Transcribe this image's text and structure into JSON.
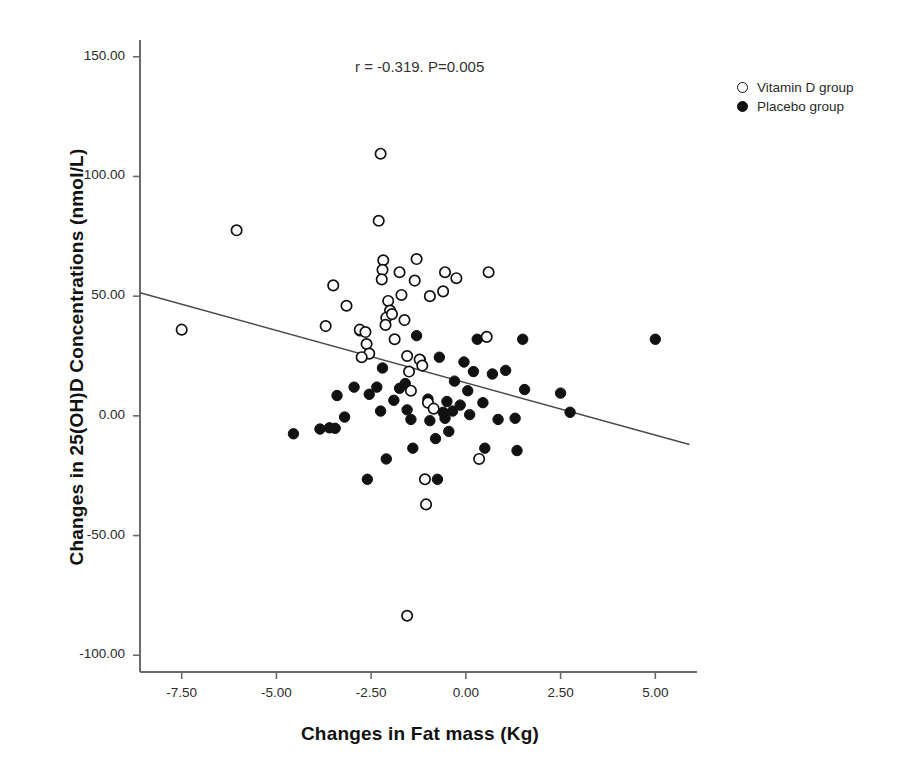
{
  "chart_data": {
    "type": "scatter",
    "title": "",
    "xlabel": "Changes in Fat mass (Kg)",
    "ylabel": "Changes in 25(OH)D Concentrations (nmol/L)",
    "annotation": "r = -0.319. P=0.005",
    "correlation_r": -0.319,
    "p_value": 0.005,
    "grid": false,
    "legend_position": "right-top",
    "xlim": [
      -8.6,
      6.1
    ],
    "ylim": [
      -107,
      157
    ],
    "xticks": [
      -7.5,
      -5.0,
      -2.5,
      0.0,
      2.5,
      5.0
    ],
    "xtick_labels": [
      "-7.50",
      "-5.00",
      "-2.50",
      "0.00",
      "2.50",
      "5.00"
    ],
    "yticks": [
      150,
      100,
      50,
      0,
      -50,
      -100
    ],
    "ytick_labels": [
      "150.00",
      "100.00",
      "50.00",
      "0.00",
      "-50.00",
      "-100.00"
    ],
    "regression_line": {
      "x_start": -8.6,
      "y_start": 51.4,
      "x_end": 5.9,
      "y_end": -12.0,
      "slope": -4.37,
      "intercept": 13.8
    },
    "series": [
      {
        "name": "Vitamin D group",
        "marker": "open-circle",
        "color": "#111111",
        "points": [
          [
            -7.5,
            36.0
          ],
          [
            -6.05,
            77.5
          ],
          [
            -3.5,
            54.5
          ],
          [
            -3.7,
            37.5
          ],
          [
            -3.15,
            46.0
          ],
          [
            -2.8,
            36.0
          ],
          [
            -2.65,
            35.0
          ],
          [
            -2.62,
            30.0
          ],
          [
            -2.55,
            26.0
          ],
          [
            -2.75,
            24.5
          ],
          [
            -2.25,
            109.5
          ],
          [
            -2.3,
            81.5
          ],
          [
            -2.18,
            65.0
          ],
          [
            -2.2,
            61.0
          ],
          [
            -2.22,
            57.0
          ],
          [
            -2.05,
            48.0
          ],
          [
            -2.0,
            44.0
          ],
          [
            -2.1,
            41.0
          ],
          [
            -2.12,
            38.0
          ],
          [
            -1.95,
            42.5
          ],
          [
            -1.88,
            32.0
          ],
          [
            -1.75,
            60.0
          ],
          [
            -1.7,
            50.5
          ],
          [
            -1.62,
            40.0
          ],
          [
            -1.55,
            25.0
          ],
          [
            -1.5,
            18.5
          ],
          [
            -1.45,
            10.5
          ],
          [
            -1.3,
            65.5
          ],
          [
            -1.35,
            56.5
          ],
          [
            -1.22,
            23.5
          ],
          [
            -1.15,
            21.0
          ],
          [
            -1.05,
            -37.0
          ],
          [
            -1.08,
            -26.5
          ],
          [
            -0.95,
            50.0
          ],
          [
            -1.0,
            5.5
          ],
          [
            -0.85,
            3.0
          ],
          [
            -0.55,
            60.0
          ],
          [
            -0.6,
            52.0
          ],
          [
            -0.25,
            57.5
          ],
          [
            0.55,
            33.0
          ],
          [
            0.6,
            60.0
          ],
          [
            0.35,
            -18.0
          ],
          [
            -1.55,
            -83.5
          ]
        ]
      },
      {
        "name": "Placebo group",
        "marker": "filled-circle",
        "color": "#111111",
        "points": [
          [
            -4.55,
            -7.5
          ],
          [
            -3.85,
            -5.5
          ],
          [
            -3.6,
            -5.0
          ],
          [
            -3.45,
            -5.2
          ],
          [
            -3.4,
            8.5
          ],
          [
            -3.2,
            -0.5
          ],
          [
            -2.95,
            12.0
          ],
          [
            -2.8,
            35.5
          ],
          [
            -2.55,
            9.0
          ],
          [
            -2.6,
            -26.5
          ],
          [
            -2.35,
            12.0
          ],
          [
            -2.2,
            20.0
          ],
          [
            -2.25,
            2.0
          ],
          [
            -2.1,
            -18.0
          ],
          [
            -1.9,
            6.5
          ],
          [
            -1.75,
            11.5
          ],
          [
            -1.6,
            13.5
          ],
          [
            -1.55,
            2.5
          ],
          [
            -1.45,
            -1.5
          ],
          [
            -1.4,
            -13.5
          ],
          [
            -1.3,
            33.5
          ],
          [
            -1.2,
            23.5
          ],
          [
            -1.0,
            7.0
          ],
          [
            -0.95,
            -2.0
          ],
          [
            -0.8,
            -9.5
          ],
          [
            -0.75,
            -26.5
          ],
          [
            -0.7,
            24.5
          ],
          [
            -0.6,
            1.5
          ],
          [
            -0.55,
            -1.0
          ],
          [
            -0.5,
            6.0
          ],
          [
            -0.45,
            -6.5
          ],
          [
            -0.35,
            2.0
          ],
          [
            -0.3,
            14.5
          ],
          [
            -0.15,
            4.5
          ],
          [
            -0.05,
            22.5
          ],
          [
            0.05,
            10.5
          ],
          [
            0.1,
            0.5
          ],
          [
            0.2,
            18.5
          ],
          [
            0.3,
            32.0
          ],
          [
            0.45,
            5.5
          ],
          [
            0.5,
            -13.5
          ],
          [
            0.7,
            17.5
          ],
          [
            0.85,
            -1.5
          ],
          [
            1.05,
            19.0
          ],
          [
            1.3,
            -1.0
          ],
          [
            1.35,
            -14.5
          ],
          [
            1.5,
            32.0
          ],
          [
            1.55,
            11.0
          ],
          [
            2.5,
            9.5
          ],
          [
            2.75,
            1.5
          ],
          [
            5.0,
            32.0
          ]
        ]
      }
    ]
  },
  "legend": {
    "items": [
      {
        "label": "Vitamin D group",
        "marker": "open"
      },
      {
        "label": "Placebo group",
        "marker": "filled"
      }
    ]
  }
}
